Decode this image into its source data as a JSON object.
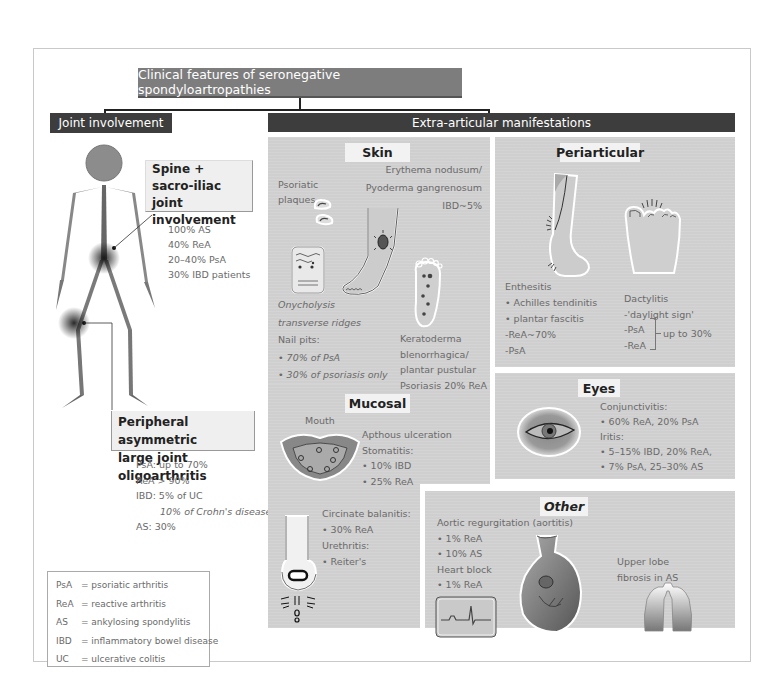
{
  "title": "Clinical features of seronegative spondyloartropathies",
  "branches": {
    "joint": "Joint involvement",
    "extra": "Extra-articular manifestations"
  },
  "joint": {
    "spine_callout": [
      "Spine +",
      "sacro-iliac joint",
      "involvement"
    ],
    "spine_stats": [
      "100% AS",
      "40% ReA",
      "20–40% PsA",
      "30% IBD patients"
    ],
    "peripheral_callout": [
      "Peripheral asymmetric",
      "large joint oligoarthritis"
    ],
    "peripheral_stats": [
      "PsA: up to 70%",
      "ReA > 90%",
      "IBD: 5% of UC",
      "10% of Crohn's disease",
      "AS:  30%"
    ]
  },
  "legend": [
    {
      "abbr": "PsA",
      "def": "= psoriatic arthritis"
    },
    {
      "abbr": "ReA",
      "def": "= reactive arthritis"
    },
    {
      "abbr": "AS",
      "def": "= ankylosing spondylitis"
    },
    {
      "abbr": "IBD",
      "def": "= inflammatory bowel disease"
    },
    {
      "abbr": "UC",
      "def": "= ulcerative colitis"
    }
  ],
  "skin": {
    "label": "Skin",
    "psoriatic": [
      "Psoriatic",
      "plaques"
    ],
    "erythema": [
      "Erythema nodusum/",
      "Pyoderma gangrenosum",
      "IBD~5%"
    ],
    "nail": [
      "Onycholysis",
      "transverse ridges",
      "Nail pits:",
      "• 70% of PsA",
      "• 30% of psoriasis only"
    ],
    "kerato": [
      "Keratoderma",
      "blenorrhagica/",
      "plantar pustular",
      "Psoriasis 20% ReA"
    ]
  },
  "mucosal": {
    "label": "Mucosal",
    "mouth": "Mouth",
    "oral": [
      "Apthous ulceration",
      "Stomatitis:",
      "•  10% IBD",
      "•  25% ReA"
    ],
    "genital": [
      "Circinate balanitis:",
      "•  30% ReA",
      "Urethritis:",
      "•  Reiter's"
    ]
  },
  "periarticular": {
    "label": "Periarticular",
    "enthesitis": [
      "Enthesitis",
      "• Achilles tendinitis",
      "• plantar fascitis",
      "-ReA~70%",
      "-PsA"
    ],
    "dactylitis": [
      "Dactylitis",
      "-'daylight sign'",
      "-PsA",
      "-ReA"
    ],
    "dactylitis_range": "up to 30%"
  },
  "eyes": {
    "label": "Eyes",
    "items": [
      "Conjunctivitis:",
      "•  60% ReA, 20% PsA",
      "Iritis:",
      "•  5–15% IBD, 20% ReA,",
      "•  7% PsA, 25–30% AS"
    ]
  },
  "other": {
    "label": "Other",
    "cardiac": [
      "Aortic regurgitation (aortitis)",
      "• 1% ReA",
      "• 10% AS",
      "Heart block",
      "• 1% ReA"
    ],
    "lung": [
      "Upper lobe",
      "fibrosis in AS"
    ]
  },
  "colors": {
    "panel": "#cfcfcf",
    "header_dark": "#3d3d3d",
    "title_bg": "#7d7d7d",
    "tag_bg": "#f2f2f2"
  }
}
